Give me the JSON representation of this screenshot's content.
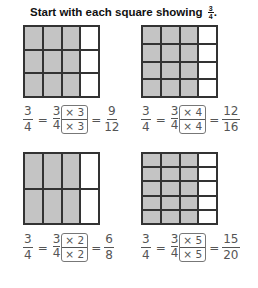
{
  "title": {
    "text": "Start with each square showing",
    "frac_num": "3",
    "frac_den": "4",
    "period": "."
  },
  "panels": [
    {
      "cols": 4,
      "rows": 3,
      "shaded_cols": 3,
      "eq": {
        "a_num": "3",
        "a_den": "4",
        "b_num": "3",
        "b_den": "4",
        "m_top": "× 3",
        "m_bot": "× 3",
        "r_num": "9",
        "r_den": "12"
      }
    },
    {
      "cols": 4,
      "rows": 4,
      "shaded_cols": 3,
      "eq": {
        "a_num": "3",
        "a_den": "4",
        "b_num": "3",
        "b_den": "4",
        "m_top": "× 4",
        "m_bot": "× 4",
        "r_num": "12",
        "r_den": "16"
      }
    },
    {
      "cols": 4,
      "rows": 2,
      "shaded_cols": 3,
      "eq": {
        "a_num": "3",
        "a_den": "4",
        "b_num": "3",
        "b_den": "4",
        "m_top": "× 2",
        "m_bot": "× 2",
        "r_num": "6",
        "r_den": "8"
      }
    },
    {
      "cols": 4,
      "rows": 5,
      "shaded_cols": 3,
      "eq": {
        "a_num": "3",
        "a_den": "4",
        "b_num": "3",
        "b_den": "4",
        "m_top": "× 5",
        "m_bot": "× 5",
        "r_num": "15",
        "r_den": "20"
      }
    }
  ],
  "symbols": {
    "equals": "="
  }
}
